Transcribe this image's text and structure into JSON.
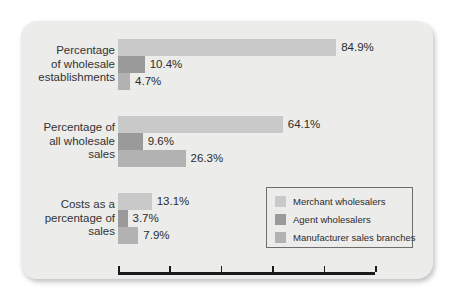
{
  "chart_data": {
    "type": "bar",
    "orientation": "horizontal",
    "title": "",
    "xlabel": "",
    "ylabel": "",
    "xlim": [
      0,
      100
    ],
    "xticks": [
      0,
      20,
      40,
      60,
      80,
      100
    ],
    "xtick_labels": [
      "0.0%",
      "20.0%",
      "40.0%",
      "60.0%",
      "80.0%",
      "100.0%"
    ],
    "grid": false,
    "legend_position": "inside-bottom-right",
    "categories": [
      "Percentage of wholesale establishments",
      "Percentage of all wholesale sales",
      "Costs as a percentage of sales"
    ],
    "category_lines": [
      [
        "Percentage",
        "of wholesale",
        "establishments"
      ],
      [
        "Percentage of",
        "all wholesale",
        "sales"
      ],
      [
        "Costs as a",
        "percentage of",
        "sales"
      ]
    ],
    "series": [
      {
        "name": "Merchant wholesalers",
        "color": "#c9c9c9",
        "values": [
          84.9,
          64.1,
          13.1
        ],
        "labels": [
          "84.9%",
          "64.1%",
          "13.1%"
        ]
      },
      {
        "name": "Agent wholesalers",
        "color": "#9a9a9a",
        "values": [
          10.4,
          9.6,
          3.7
        ],
        "labels": [
          "10.4%",
          "9.6%",
          "3.7%"
        ]
      },
      {
        "name": "Manufacturer sales branches",
        "color": "#b2b2b2",
        "values": [
          4.7,
          26.3,
          7.9
        ],
        "labels": [
          "4.7%",
          "26.3%",
          "7.9%"
        ]
      }
    ]
  },
  "legend": {
    "items": [
      {
        "label": "Merchant wholesalers",
        "color": "#c9c9c9"
      },
      {
        "label": "Agent wholesalers",
        "color": "#9a9a9a"
      },
      {
        "label": "Manufacturer sales branches",
        "color": "#b2b2b2"
      }
    ]
  },
  "background_bleed": {
    "line1": "",
    "line2": ""
  }
}
